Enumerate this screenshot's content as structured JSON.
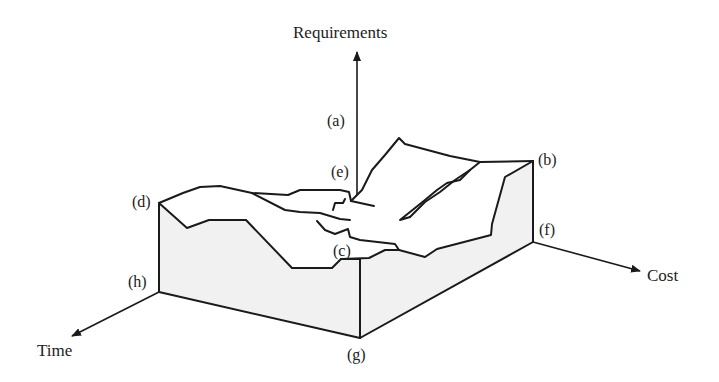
{
  "diagram": {
    "type": "3d-landscape-box",
    "axes": {
      "vertical": "Requirements",
      "left": "Time",
      "right": "Cost"
    },
    "points": {
      "a": "(a)",
      "b": "(b)",
      "c": "(c)",
      "d": "(d)",
      "e": "(e)",
      "f": "(f)",
      "g": "(g)",
      "h": "(h)"
    },
    "colors": {
      "line": "#1a1a1a",
      "face_fill": "#f1f1f1",
      "background": "#ffffff"
    }
  }
}
